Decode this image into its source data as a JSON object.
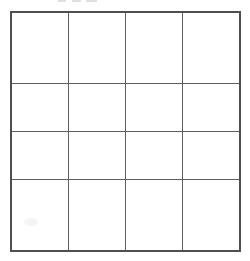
{
  "document": {
    "type": "scanned-grid-worksheet",
    "background_color": "#ffffff",
    "line_color": "#5d5d5d",
    "outer_line_color": "#4f4f4f"
  },
  "top_remnant": {
    "description": "faint cropped ink marks clipped by the top edge of the scan",
    "visible_text": ""
  },
  "grid": {
    "rows": 4,
    "columns": 4,
    "cells": [
      [
        "",
        "",
        "",
        ""
      ],
      [
        "",
        "",
        "",
        ""
      ],
      [
        "",
        "",
        "",
        ""
      ],
      [
        "",
        "",
        "",
        ""
      ]
    ]
  }
}
